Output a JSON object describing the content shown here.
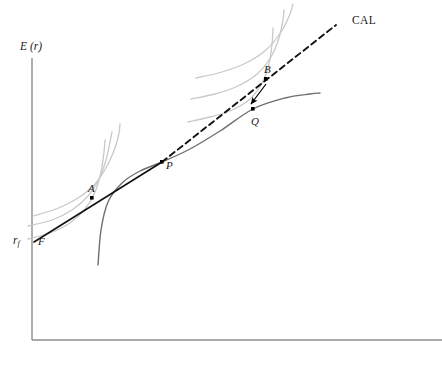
{
  "figure": {
    "background": "#ffffff",
    "axis_color": "#8c8c8c",
    "cal_color": "#111111",
    "frontier_color": "#6f6f6f",
    "indifference_color": "#c9c9c9",
    "point_color": "#000000",
    "label_color": "#1a1a1a"
  },
  "axes": {
    "y_label": "E (r)",
    "y_label_plain": "E (r)",
    "x_label": "",
    "rf_label": "r",
    "rf_subscript": "f",
    "origin_x": 32,
    "origin_y": 340,
    "y_top": 58,
    "x_right": 442
  },
  "labels": {
    "F": "F",
    "A": "A",
    "P": "P",
    "B": "B",
    "Q": "Q",
    "CAL": "CAL"
  },
  "chart_data": {
    "type": "line",
    "title": "",
    "subtitle": "",
    "xlabel": "",
    "ylabel": "E (r)",
    "grid": false,
    "legend": "none",
    "axis_ticks": [],
    "xlim": [
      32,
      442
    ],
    "ylim": [
      58,
      340
    ],
    "annotations": [
      {
        "name": "rf",
        "text": "r_f",
        "x": 20,
        "y": 241,
        "note": "risk-free rate intercept on vertical axis"
      },
      {
        "name": "CAL",
        "text": "CAL",
        "x": 355,
        "y": 22,
        "note": "capital allocation line label"
      }
    ],
    "points": [
      {
        "name": "F",
        "label": "F",
        "x": 34,
        "y": 242,
        "label_dx": 6,
        "label_dy": 9,
        "dot": false,
        "note": "risk-free point on vertical axis, origin of CAL"
      },
      {
        "name": "A",
        "label": "A",
        "x": 92,
        "y": 198,
        "label_dx": -4,
        "label_dy": -6,
        "dot": true,
        "note": "lending portfolio on CAL, tangent to lower indifference curve"
      },
      {
        "name": "P",
        "label": "P",
        "x": 162,
        "y": 162,
        "label_dx": 4,
        "label_dy": 9,
        "dot": true,
        "note": "optimal risky portfolio: tangency of CAL with efficient frontier"
      },
      {
        "name": "B",
        "label": "B",
        "x": 266,
        "y": 79,
        "label_dx": -2,
        "label_dy": -5,
        "dot": true,
        "note": "levered portfolio on CAL above frontier"
      },
      {
        "name": "Q",
        "label": "Q",
        "x": 253,
        "y": 109,
        "label_dx": -2,
        "label_dy": 14,
        "dot": true,
        "note": "portfolio on efficient frontier below B"
      }
    ],
    "series": [
      {
        "name": "CAL-solid",
        "kind": "line",
        "style": "solid",
        "color": "#111111",
        "width": 1.6,
        "points": [
          [
            34,
            242
          ],
          [
            162,
            162
          ]
        ],
        "note": "solid segment of capital allocation line from F through A to P"
      },
      {
        "name": "CAL-dashed",
        "kind": "line",
        "style": "dashed",
        "color": "#111111",
        "width": 1.9,
        "dash": "6,4",
        "points": [
          [
            162,
            162
          ],
          [
            336,
            25
          ]
        ],
        "note": "dashed extension of CAL beyond tangency point P, past B"
      },
      {
        "name": "efficient-frontier",
        "kind": "curve",
        "style": "solid",
        "color": "#6f6f6f",
        "width": 1.4,
        "points": [
          [
            98,
            265
          ],
          [
            101,
            230
          ],
          [
            108,
            202
          ],
          [
            122,
            183
          ],
          [
            140,
            171
          ],
          [
            162,
            162
          ],
          [
            190,
            149
          ],
          [
            220,
            131
          ],
          [
            253,
            109
          ],
          [
            285,
            98
          ],
          [
            310,
            94
          ],
          [
            320,
            93
          ]
        ],
        "note": "concave efficient frontier of risky assets passing through P and Q"
      },
      {
        "name": "indifference-curve-low-1",
        "kind": "curve",
        "style": "solid",
        "color": "#c9c9c9",
        "width": 1.3,
        "points": [
          [
            28,
            239
          ],
          [
            50,
            233
          ],
          [
            70,
            223
          ],
          [
            85,
            209
          ],
          [
            95,
            192
          ],
          [
            101,
            172
          ],
          [
            104,
            152
          ],
          [
            105,
            140
          ]
        ],
        "note": "lowest utility indifference curve, lower-left family"
      },
      {
        "name": "indifference-curve-low-2",
        "kind": "curve",
        "style": "solid",
        "color": "#c9c9c9",
        "width": 1.3,
        "points": [
          [
            28,
            226
          ],
          [
            52,
            220
          ],
          [
            72,
            210
          ],
          [
            88,
            196
          ],
          [
            99,
            179
          ],
          [
            106,
            160
          ],
          [
            110,
            142
          ],
          [
            112,
            132
          ]
        ],
        "note": "middle indifference curve tangent to CAL near point A"
      },
      {
        "name": "indifference-curve-low-3",
        "kind": "curve",
        "style": "solid",
        "color": "#c9c9c9",
        "width": 1.3,
        "points": [
          [
            33,
            216
          ],
          [
            56,
            209
          ],
          [
            78,
            198
          ],
          [
            95,
            184
          ],
          [
            107,
            166
          ],
          [
            115,
            148
          ],
          [
            119,
            133
          ],
          [
            120,
            124
          ]
        ],
        "note": "highest indifference curve of lower-left family"
      },
      {
        "name": "indifference-curve-high-1",
        "kind": "curve",
        "style": "solid",
        "color": "#c9c9c9",
        "width": 1.3,
        "points": [
          [
            188,
            122
          ],
          [
            210,
            117
          ],
          [
            232,
            110
          ],
          [
            250,
            99
          ],
          [
            262,
            83
          ],
          [
            269,
            64
          ],
          [
            272,
            44
          ],
          [
            273,
            28
          ]
        ],
        "note": "lowest indifference curve of upper-right family"
      },
      {
        "name": "indifference-curve-high-2",
        "kind": "curve",
        "style": "solid",
        "color": "#c9c9c9",
        "width": 1.3,
        "points": [
          [
            191,
            99
          ],
          [
            215,
            94
          ],
          [
            238,
            86
          ],
          [
            257,
            74
          ],
          [
            271,
            57
          ],
          [
            279,
            38
          ],
          [
            283,
            20
          ],
          [
            284,
            10
          ]
        ],
        "note": "middle indifference curve of upper-right family, tangent near B"
      },
      {
        "name": "indifference-curve-high-3",
        "kind": "curve",
        "style": "solid",
        "color": "#c9c9c9",
        "width": 1.3,
        "points": [
          [
            196,
            78
          ],
          [
            222,
            72
          ],
          [
            246,
            63
          ],
          [
            266,
            50
          ],
          [
            281,
            32
          ],
          [
            290,
            14
          ],
          [
            293,
            4
          ]
        ],
        "note": "highest indifference curve of upper-right family"
      }
    ],
    "arrows": [
      {
        "name": "B-to-Q",
        "from": [
          266,
          84
        ],
        "to": [
          251,
          104
        ],
        "color": "#000000",
        "note": "arrow indicating move from levered CAL portfolio B down to frontier portfolio Q"
      }
    ]
  }
}
